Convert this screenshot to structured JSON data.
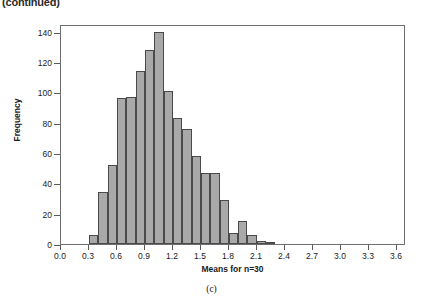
{
  "figure": {
    "continued_note": "(continued)",
    "panel_caption": "(c)"
  },
  "chart_data": {
    "type": "bar",
    "title": "",
    "subtitle": "",
    "xlabel": "Means for n=30",
    "ylabel": "Frequency",
    "xlim": [
      0.0,
      3.7
    ],
    "ylim": [
      0,
      145
    ],
    "grid": false,
    "legend": null,
    "bin_width": 0.1,
    "bar_color": "#a9a9a9",
    "bar_edge_color": "#4a4a4a",
    "xticks": [
      "0.0",
      "0.3",
      "0.6",
      "0.9",
      "1.2",
      "1.5",
      "1.8",
      "2.1",
      "2.4",
      "2.7",
      "3.0",
      "3.3",
      "3.6"
    ],
    "xtick_values": [
      0.0,
      0.3,
      0.6,
      0.9,
      1.2,
      1.5,
      1.8,
      2.1,
      2.4,
      2.7,
      3.0,
      3.3,
      3.6
    ],
    "yticks": [
      "0",
      "20",
      "40",
      "60",
      "80",
      "100",
      "120",
      "140"
    ],
    "ytick_values": [
      0,
      20,
      40,
      60,
      80,
      100,
      120,
      140
    ],
    "categories": [
      "0.30",
      "0.40",
      "0.50",
      "0.60",
      "0.70",
      "0.80",
      "0.90",
      "1.00",
      "1.10",
      "1.20",
      "1.30",
      "1.40",
      "1.50",
      "1.60",
      "1.70",
      "1.80",
      "1.90",
      "2.00",
      "2.10",
      "2.20"
    ],
    "bin_starts": [
      0.3,
      0.4,
      0.5,
      0.6,
      0.7,
      0.8,
      0.9,
      1.0,
      1.1,
      1.2,
      1.3,
      1.4,
      1.5,
      1.6,
      1.7,
      1.8,
      1.9,
      2.0,
      2.1,
      2.2
    ],
    "values": [
      6,
      34,
      52,
      96,
      97,
      114,
      128,
      140,
      101,
      83,
      76,
      58,
      47,
      47,
      29,
      7,
      15,
      6,
      2,
      1
    ]
  }
}
